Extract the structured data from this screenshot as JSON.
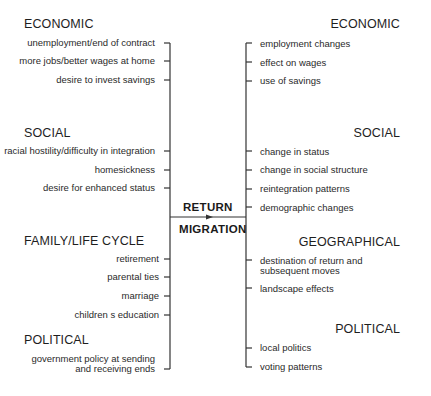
{
  "center": {
    "line1": "RETURN",
    "line2": "MIGRATION"
  },
  "causes": {
    "economic": {
      "heading": "ECONOMIC",
      "items": [
        "unemployment/end of contract",
        "more jobs/better wages at home",
        "desire to invest savings"
      ]
    },
    "social": {
      "heading": "SOCIAL",
      "items": [
        "racial hostility/difficulty in integration",
        "homesickness",
        "desire for enhanced status"
      ]
    },
    "family": {
      "heading": "FAMILY/LIFE CYCLE",
      "items": [
        "retirement",
        "parental ties",
        "marriage",
        "children s education"
      ]
    },
    "political": {
      "heading": "POLITICAL",
      "items_line1": "government policy at sending",
      "items_line2": "and receiving ends"
    }
  },
  "effects": {
    "economic": {
      "heading": "ECONOMIC",
      "items": [
        "employment changes",
        "effect on wages",
        "use of savings"
      ]
    },
    "social": {
      "heading": "SOCIAL",
      "items": [
        "change in status",
        "change in social structure",
        "reintegration patterns",
        "demographic changes"
      ]
    },
    "geographical": {
      "heading": "GEOGRAPHICAL",
      "items_line1": "destination of return and",
      "items_line2": "subsequent moves",
      "items": [
        "landscape effects"
      ]
    },
    "political": {
      "heading": "POLITICAL",
      "items": [
        "local politics",
        "voting patterns"
      ]
    }
  }
}
